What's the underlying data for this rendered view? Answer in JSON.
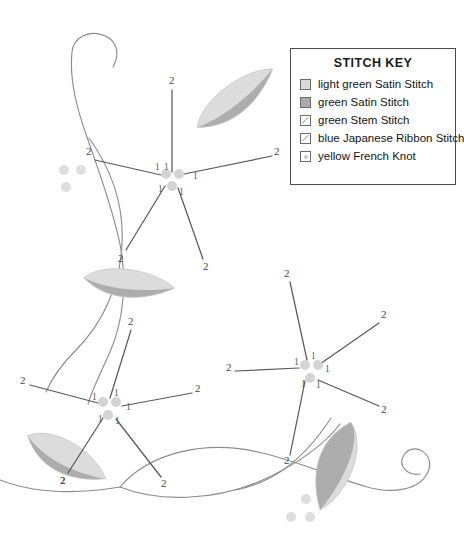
{
  "document": {
    "type": "embroidery-stitch-pattern-diagram",
    "title": "Floral Vine Embroidery Pattern"
  },
  "legend": {
    "title": "STITCH KEY",
    "items": [
      {
        "swatch": "light-green-satin-swatch",
        "style": "fill-light",
        "label": "light green Satin Stitch"
      },
      {
        "swatch": "green-satin-swatch",
        "style": "fill-dark",
        "label": "green Satin Stitch"
      },
      {
        "swatch": "green-stem-swatch",
        "style": "diag",
        "label": "green Stem Stitch"
      },
      {
        "swatch": "blue-japanese-ribbon-swatch",
        "style": "diag",
        "label": "blue Japanese Ribbon Stitch"
      },
      {
        "swatch": "yellow-french-knot-swatch",
        "style": "knot",
        "label": "yellow French Knot"
      }
    ]
  },
  "colors": {
    "leaf_light": "#dcdcdc",
    "leaf_dark": "#adadad",
    "vine_stroke": "#8c8c8c",
    "petal_stroke": "#5a5a5a",
    "french_knot": "#d5d5d5",
    "flower_center_knot": "#d0d0d0",
    "label_text": "#4a4a4a",
    "legend_border": "#4d4d4d",
    "background": "#ffffff"
  },
  "stitch_order": {
    "inner_label": "1",
    "outer_label": "2",
    "note": "Each petal is numbered 1 at the flower center end and 2 at the outer tip."
  },
  "flowers": [
    {
      "name": "top-flower",
      "center": {
        "x": 172,
        "y": 177
      },
      "center_knots": [
        {
          "x": 166,
          "y": 174
        },
        {
          "x": 178,
          "y": 174
        },
        {
          "x": 172,
          "y": 185
        }
      ],
      "petals": [
        {
          "name": "petal-up",
          "inner": "1",
          "outer": "2",
          "inner_at": {
            "x": 166,
            "y": 167
          },
          "outer_at": {
            "x": 172,
            "y": 83
          }
        },
        {
          "name": "petal-upper-right",
          "inner": "1",
          "outer": "2",
          "inner_at": {
            "x": 196,
            "y": 176
          },
          "outer_at": {
            "x": 279,
            "y": 155
          }
        },
        {
          "name": "petal-left",
          "inner": "1",
          "outer": "2",
          "inner_at": {
            "x": 158,
            "y": 170
          },
          "outer_at": {
            "x": 88,
            "y": 155
          }
        },
        {
          "name": "petal-lower-left",
          "inner": "1",
          "outer": "2",
          "inner_at": {
            "x": 160,
            "y": 190
          },
          "outer_at": {
            "x": 121,
            "y": 257
          }
        },
        {
          "name": "petal-lower-right",
          "inner": "1",
          "outer": "2",
          "inner_at": {
            "x": 180,
            "y": 192
          },
          "outer_at": {
            "x": 206,
            "y": 266
          }
        }
      ]
    },
    {
      "name": "bottom-left-flower",
      "center": {
        "x": 108,
        "y": 405
      },
      "center_knots": [
        {
          "x": 102,
          "y": 402
        },
        {
          "x": 114,
          "y": 402
        },
        {
          "x": 108,
          "y": 415
        }
      ],
      "petals": [
        {
          "name": "petal-up",
          "inner": "1",
          "outer": "2",
          "inner_at": {
            "x": 117,
            "y": 392
          },
          "outer_at": {
            "x": 130,
            "y": 322
          }
        },
        {
          "name": "petal-left",
          "inner": "1",
          "outer": "2",
          "inner_at": {
            "x": 96,
            "y": 398
          },
          "outer_at": {
            "x": 22,
            "y": 380
          }
        },
        {
          "name": "petal-right",
          "inner": "1",
          "outer": "2",
          "inner_at": {
            "x": 128,
            "y": 405
          },
          "outer_at": {
            "x": 199,
            "y": 390
          }
        },
        {
          "name": "petal-lower-left",
          "inner": "1",
          "outer": "2",
          "inner_at": {
            "x": 100,
            "y": 419
          },
          "outer_at": {
            "x": 63,
            "y": 479
          }
        },
        {
          "name": "petal-lower-right",
          "inner": "1",
          "outer": "2",
          "inner_at": {
            "x": 115,
            "y": 423
          },
          "outer_at": {
            "x": 165,
            "y": 483
          }
        }
      ]
    },
    {
      "name": "bottom-right-flower",
      "center": {
        "x": 312,
        "y": 368
      },
      "center_knots": [
        {
          "x": 306,
          "y": 365
        },
        {
          "x": 318,
          "y": 365
        },
        {
          "x": 309,
          "y": 378
        }
      ],
      "petals": [
        {
          "name": "petal-up",
          "inner": "1",
          "outer": "2",
          "inner_at": {
            "x": 309,
            "y": 356
          },
          "outer_at": {
            "x": 286,
            "y": 275
          }
        },
        {
          "name": "petal-upper-right",
          "inner": "1",
          "outer": "2",
          "inner_at": {
            "x": 326,
            "y": 372
          },
          "outer_at": {
            "x": 383,
            "y": 318
          }
        },
        {
          "name": "petal-left",
          "inner": "1",
          "outer": "2",
          "inner_at": {
            "x": 297,
            "y": 367
          },
          "outer_at": {
            "x": 228,
            "y": 371
          }
        },
        {
          "name": "petal-right",
          "inner": "1",
          "outer": "2",
          "inner_at": {
            "x": 320,
            "y": 385
          },
          "outer_at": {
            "x": 385,
            "y": 410
          }
        },
        {
          "name": "petal-lower-left",
          "inner": "1",
          "outer": "2",
          "inner_at": {
            "x": 299,
            "y": 383
          },
          "outer_at": {
            "x": 287,
            "y": 461
          }
        }
      ]
    }
  ],
  "leaves": [
    {
      "name": "leaf-top-right",
      "x": 236,
      "y": 102,
      "rotation": -28,
      "w": 92,
      "h": 50
    },
    {
      "name": "leaf-middle-left",
      "x": 127,
      "y": 287,
      "rotation": 18,
      "w": 88,
      "h": 46
    },
    {
      "name": "leaf-bottom-left",
      "x": 60,
      "y": 460,
      "rotation": 42,
      "w": 86,
      "h": 56
    },
    {
      "name": "leaf-bottom-right",
      "x": 330,
      "y": 460,
      "rotation": -62,
      "w": 92,
      "h": 58
    }
  ],
  "french_knot_clusters": [
    {
      "name": "knot-cluster-upper-left",
      "dots": [
        {
          "x": 64,
          "y": 170
        },
        {
          "x": 80,
          "y": 170
        },
        {
          "x": 66,
          "y": 186
        }
      ]
    },
    {
      "name": "knot-cluster-bottom",
      "dots": [
        {
          "x": 306,
          "y": 498
        },
        {
          "x": 291,
          "y": 516
        },
        {
          "x": 309,
          "y": 516
        }
      ]
    }
  ],
  "vines": [
    {
      "name": "vine-left-curl",
      "stitch": "green Stem Stitch"
    },
    {
      "name": "vine-left-loop",
      "stitch": "green Stem Stitch"
    },
    {
      "name": "vine-bottom-wave",
      "stitch": "green Stem Stitch"
    },
    {
      "name": "vine-bottom-curl",
      "stitch": "green Stem Stitch"
    }
  ]
}
